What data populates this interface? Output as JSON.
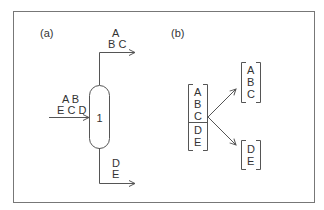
{
  "panel_a": {
    "label": "(a)",
    "top_product": {
      "line1": "A",
      "line2": "B C"
    },
    "feed": {
      "line1": "A B",
      "line2": "E C D"
    },
    "column_label": "1",
    "bottom_product": {
      "line1": "D",
      "line2": "E"
    }
  },
  "panel_b": {
    "label": "(b)",
    "feed_stack": [
      "A",
      "B",
      "C",
      "D",
      "E"
    ],
    "top_group": [
      "A",
      "B",
      "C"
    ],
    "bottom_group": [
      "D",
      "E"
    ]
  },
  "colors": {
    "stroke": "#555555",
    "text": "#333333",
    "frame": "#777777"
  }
}
